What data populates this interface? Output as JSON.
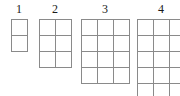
{
  "canvas": {
    "width": 180,
    "height": 96,
    "background": "#ffffff",
    "line_color": "#8a8a8a",
    "label_color": "#1a1a1a",
    "cell_size": 16
  },
  "figures": [
    {
      "label": "1",
      "columns": 1,
      "rows": 2,
      "x": 11,
      "y": 19,
      "label_x": 11,
      "label_width": 16,
      "clipped": false
    },
    {
      "label": "2",
      "columns": 2,
      "rows": 3,
      "x": 39,
      "y": 19,
      "label_x": 39,
      "label_width": 32,
      "clipped": false
    },
    {
      "label": "3",
      "columns": 3,
      "rows": 4,
      "x": 81,
      "y": 19,
      "label_x": 81,
      "label_width": 48,
      "clipped": false
    },
    {
      "label": "4",
      "columns": 3,
      "rows": 5,
      "x": 137,
      "y": 19,
      "label_x": 137,
      "label_width": 48,
      "clipped": true
    }
  ]
}
